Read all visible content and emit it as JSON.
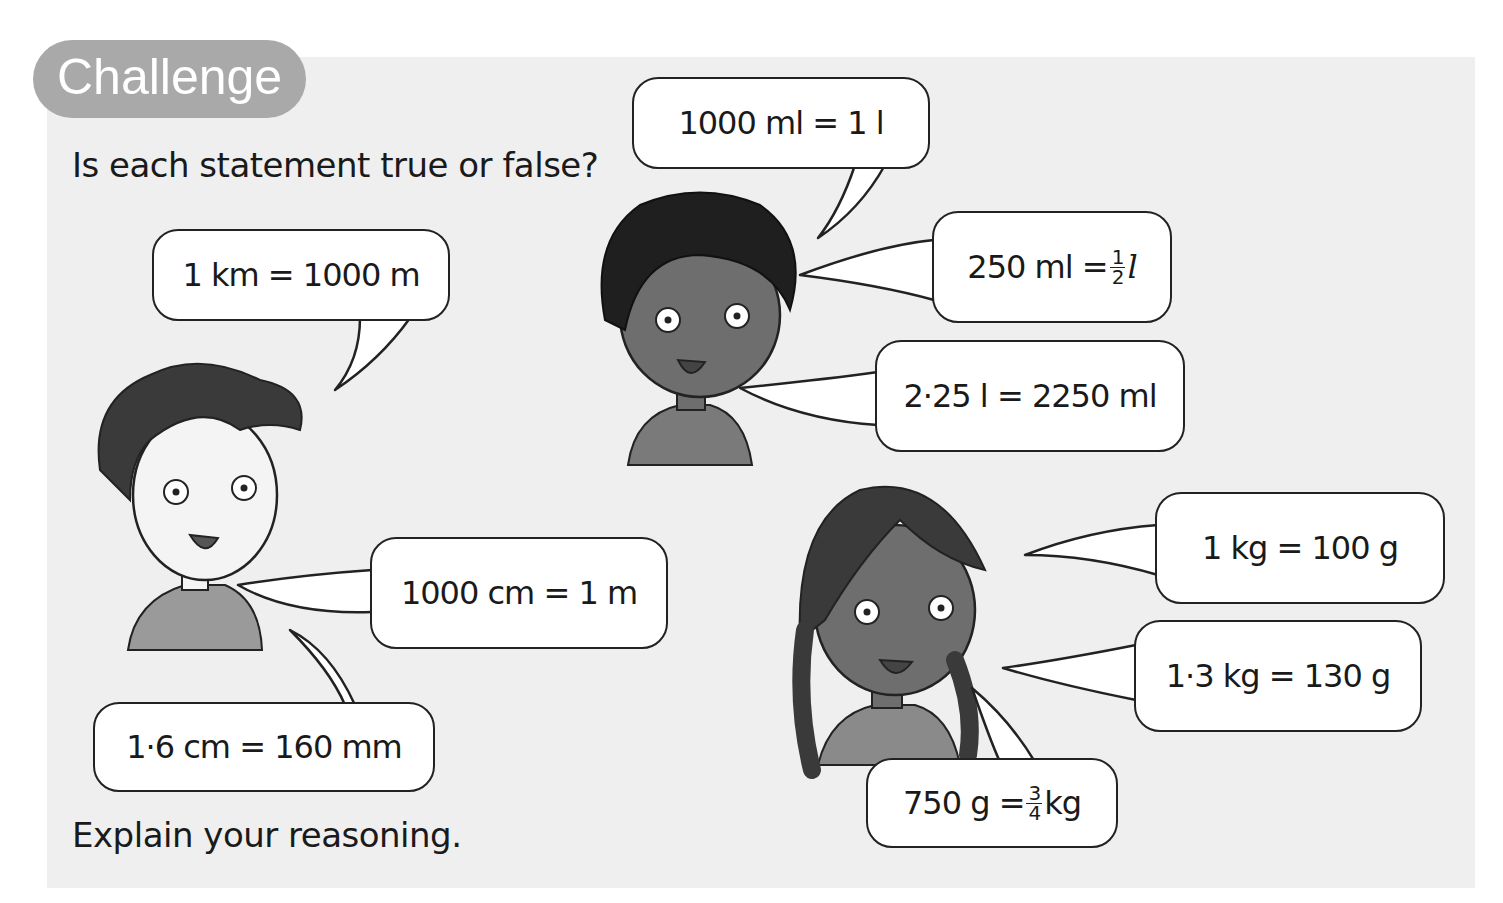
{
  "header": {
    "badge_label": "Challenge"
  },
  "instructions": {
    "question": "Is each statement true or false?",
    "follow_up": "Explain your reasoning."
  },
  "characters": [
    {
      "name": "boy-left",
      "statements": [
        {
          "id": "km-m",
          "text": "1 km = 1000 m"
        },
        {
          "id": "cm-m",
          "text": "1000 cm = 1 m"
        },
        {
          "id": "cm-mm",
          "text": "1·6 cm = 160 mm"
        }
      ]
    },
    {
      "name": "boy-center",
      "statements": [
        {
          "id": "ml-l",
          "text": "1000 ml = 1 l"
        },
        {
          "id": "ml-half-l",
          "text_before": "250 ml = ",
          "frac_num": "1",
          "frac_den": "2",
          "text_after": "l"
        },
        {
          "id": "l-ml",
          "text": "2·25 l = 2250 ml"
        }
      ]
    },
    {
      "name": "girl-right",
      "statements": [
        {
          "id": "kg-g",
          "text": "1 kg = 100 g"
        },
        {
          "id": "kg-g-decimal",
          "text": "1·3 kg = 130 g"
        },
        {
          "id": "g-three-quarter-kg",
          "text_before": "750 g = ",
          "frac_num": "3",
          "frac_den": "4",
          "text_after": "kg"
        }
      ]
    }
  ],
  "colors": {
    "panel_bg": "#efefef",
    "badge_bg": "#a9a9a9",
    "badge_text": "#ffffff",
    "bubble_bg": "#ffffff",
    "bubble_border": "#222222",
    "text": "#1a1a1a"
  }
}
